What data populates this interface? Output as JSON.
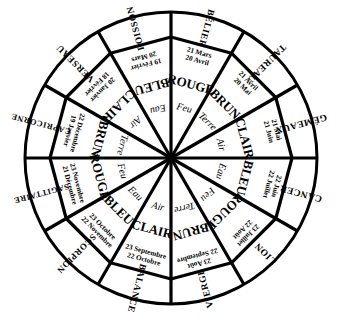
{
  "diagram": {
    "shape": "circle",
    "sector_count": 12,
    "stroke_color": "#000000",
    "background_color": "#ffffff"
  },
  "signs": [
    {
      "name": "BELIER",
      "display_name": "BÉLIER",
      "date_start": "21 Mars",
      "date_end": "20 Avril",
      "color_word": "ROUGE",
      "element": "Feu"
    },
    {
      "name": "TAUREAU",
      "display_name": "TAUREAU",
      "date_start": "21 Avril",
      "date_end": "20 Mai",
      "color_word": "BRUN",
      "element": "Terre"
    },
    {
      "name": "GEMEAUX",
      "display_name": "GÉMEAUX",
      "date_start": "21 Mai",
      "date_end": "21 Juin",
      "color_word": "CLAIR",
      "element": "Air"
    },
    {
      "name": "CANCER",
      "display_name": "CANCER",
      "date_start": "22 Juin",
      "date_end": "22 Juillet",
      "color_word": "BLEU",
      "element": "Eau"
    },
    {
      "name": "LION",
      "display_name": "LION",
      "date_start": "23 Juillet",
      "date_end": "22 Août",
      "color_word": "ROUGE",
      "element": "Feu"
    },
    {
      "name": "VIERGE",
      "display_name": "VIERGE",
      "date_start": "23 Août",
      "date_end": "22 Septembre",
      "color_word": "BRUN",
      "element": "Terre"
    },
    {
      "name": "BALANCE",
      "display_name": "BALANCE",
      "date_start": "23 Septembre",
      "date_end": "22 Octobre",
      "color_word": "CLAIR",
      "element": "Air"
    },
    {
      "name": "SCORPION",
      "display_name": "SCORPION",
      "date_start": "23 Octobre",
      "date_end": "22 Novembre",
      "color_word": "BLEU",
      "element": "Eau"
    },
    {
      "name": "SAGITTAIRE",
      "display_name": "SAGITTAIRE",
      "date_start": "23 Novembre",
      "date_end": "21 Décembre",
      "color_word": "ROUGE",
      "element": "Feu"
    },
    {
      "name": "CAPRICORNE",
      "display_name": "CAPRICORNE",
      "date_start": "22 Décembre",
      "date_end": "19 Janvier",
      "color_word": "BRUN",
      "element": "Terre"
    },
    {
      "name": "VERSEAU",
      "display_name": "VERSEAU",
      "date_start": "20 Janvier",
      "date_end": "18 Février",
      "color_word": "CLAIR",
      "element": "Air"
    },
    {
      "name": "POISSON",
      "display_name": "POISSON",
      "date_start": "19 Février",
      "date_end": "20 Mars",
      "color_word": "BLEU",
      "element": "Eau"
    }
  ]
}
